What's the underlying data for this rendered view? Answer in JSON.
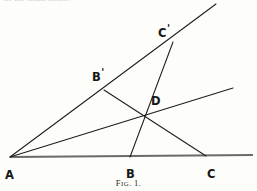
{
  "figure": {
    "caption_prefix": "F",
    "caption_smallcaps": "IG",
    "caption_suffix": ". 1.",
    "caption_full": "Fig. 1.",
    "page_bleed_text": "of the small circle.",
    "background_color": "#fdfdfa",
    "ink_color": "#1d1d1d",
    "baseline_color": "#6a6a6a",
    "width": 257,
    "height": 191
  },
  "points": [
    {
      "id": "A",
      "label": "A",
      "prime": "",
      "x": 10,
      "y": 157,
      "label_x": 5,
      "label_y": 166
    },
    {
      "id": "B",
      "label": "B",
      "prime": "",
      "x": 130,
      "y": 157,
      "label_x": 126,
      "label_y": 165
    },
    {
      "id": "C",
      "label": "C",
      "prime": "",
      "x": 205,
      "y": 157,
      "label_x": 207,
      "label_y": 165
    },
    {
      "id": "Bp",
      "label": "B",
      "prime": "'",
      "x": 104,
      "y": 90,
      "label_x": 92,
      "label_y": 68
    },
    {
      "id": "Cp",
      "label": "C",
      "prime": "'",
      "x": 172,
      "y": 44,
      "label_x": 158,
      "label_y": 24
    },
    {
      "id": "D",
      "label": "D",
      "prime": "",
      "x": 143,
      "y": 117,
      "label_x": 151,
      "label_y": 92
    }
  ],
  "segments": [
    {
      "id": "baseline",
      "from": "A",
      "to": "axis-right",
      "x1": 10,
      "y1": 157,
      "x2": 253,
      "y2": 155,
      "style": "baseline"
    },
    {
      "id": "ray-A-to-Cp",
      "from": "A",
      "to": "upper-ray",
      "x1": 10,
      "y1": 157,
      "x2": 216,
      "y2": 4,
      "style": "ink"
    },
    {
      "id": "ray-A-to-D",
      "from": "A",
      "to": "middle-ray",
      "x1": 10,
      "y1": 157,
      "x2": 233,
      "y2": 88,
      "style": "ink"
    },
    {
      "id": "seg-Bp-to-C",
      "from": "Bp",
      "to": "C",
      "x1": 104,
      "y1": 90,
      "x2": 206,
      "y2": 156,
      "style": "ink"
    },
    {
      "id": "seg-B-to-Cp",
      "from": "B",
      "to": "Cp",
      "x1": 130,
      "y1": 157,
      "x2": 173,
      "y2": 42,
      "style": "ink"
    }
  ]
}
